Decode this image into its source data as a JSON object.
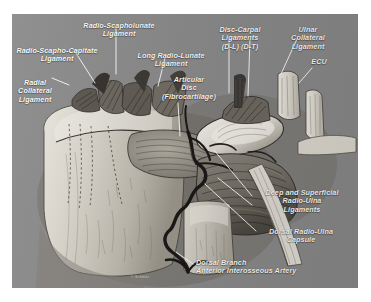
{
  "figure": {
    "background_color": "#8a8a8a",
    "page_color": "#ffffff",
    "label_color": "#ffffff",
    "signature": "© Schmitz"
  },
  "labels": [
    {
      "id": "radio-scapholunate-ligament",
      "text": "Radio-Scapholunate\nLigament",
      "x": 73,
      "y": 8,
      "align": "c",
      "width": 92
    },
    {
      "id": "radio-scapho-capitate-ligament",
      "text": "Radio-Scapho-Capitate\nLigament",
      "x": 9,
      "y": 33,
      "align": "c",
      "width": 96
    },
    {
      "id": "radial-collateral-ligament",
      "text": "Radial\nCollateral\nLigament",
      "x": 12,
      "y": 65,
      "align": "c",
      "width": 46
    },
    {
      "id": "long-radio-lunate-ligament",
      "text": "Long Radio-Lunate\nLigament",
      "x": 132,
      "y": 38,
      "align": "c",
      "width": 78
    },
    {
      "id": "articular-disc-fibrocartilage",
      "text": "Articular\nDisc\n(Fibrocartilage)",
      "x": 158,
      "y": 62,
      "align": "c",
      "width": 62
    },
    {
      "id": "disc-carpal-ligaments",
      "text": "Disc-Carpal\nLigaments\n(D-L)  (D-T)",
      "x": 209,
      "y": 12,
      "align": "c",
      "width": 62
    },
    {
      "id": "ulnar-collateral-ligament",
      "text": "Ulnar\nCollateral\nLigament",
      "x": 281,
      "y": 12,
      "align": "c",
      "width": 54
    },
    {
      "id": "ecu",
      "text": "ECU",
      "x": 305,
      "y": 58,
      "align": "c",
      "width": 28
    },
    {
      "id": "deep-and-superficial-radio-ulna-ligaments",
      "text": "Deep and Superficial\nRadio-Ulna\nLigaments",
      "x": 257,
      "y": 189,
      "align": "c",
      "width": 90
    },
    {
      "id": "dorsal-radio-ulna-capsule",
      "text": "Dorsal Radio-Ulna\nCapsule",
      "x": 259,
      "y": 228,
      "align": "c",
      "width": 84
    },
    {
      "id": "dorsal-branch-anterior-interosseous-artery",
      "text": "Dorsal Branch\nAnterior Interosseous Artery",
      "x": 196,
      "y": 259,
      "align": "l",
      "width": 122
    }
  ],
  "leaders": [
    {
      "id": "leader-radio-scapholunate",
      "points": "116,27 116,74"
    },
    {
      "id": "leader-radio-scapho-capitate",
      "points": "74,50 95,83"
    },
    {
      "id": "leader-radial-collateral",
      "points": "52,78 69,85"
    },
    {
      "id": "leader-long-radio-lunate",
      "points": "165,58 158,86"
    },
    {
      "id": "leader-articular-disc",
      "points": "178,103 180,136"
    },
    {
      "id": "leader-disc-carpal-dl",
      "points": "229,40 229,93"
    },
    {
      "id": "leader-disc-carpal-dt",
      "points": "250,40 248,96"
    },
    {
      "id": "leader-ulnar-collateral",
      "points": "297,39 281,74"
    },
    {
      "id": "leader-ecu",
      "points": "312,68 299,83"
    },
    {
      "id": "leader-deep-superficial-1",
      "points": "252,196 214,150"
    },
    {
      "id": "leader-deep-superficial-2",
      "points": "252,205 218,178"
    },
    {
      "id": "leader-dorsal-radio-ulna-capsule",
      "points": "256,231 205,184"
    },
    {
      "id": "leader-dorsal-branch-artery",
      "points": "193,264 176,252"
    }
  ]
}
